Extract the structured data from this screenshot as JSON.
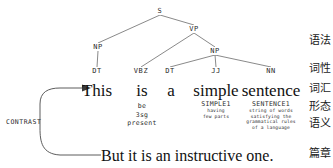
{
  "figure": {
    "background_color": "#ffffff",
    "line_color": "#6b6b6b",
    "text_color": "#1b1b1b"
  },
  "syntax_tree": {
    "nodes": [
      {
        "id": "S",
        "label": "S",
        "x": 160,
        "y": 11
      },
      {
        "id": "NP1",
        "label": "NP",
        "x": 98,
        "y": 47
      },
      {
        "id": "VP",
        "label": "VP",
        "x": 194,
        "y": 29
      },
      {
        "id": "NP2",
        "label": "NP",
        "x": 215,
        "y": 51
      },
      {
        "id": "DT1",
        "label": "DT",
        "x": 97,
        "y": 71
      },
      {
        "id": "VBZ",
        "label": "VBZ",
        "x": 141,
        "y": 71
      },
      {
        "id": "DT2",
        "label": "DT",
        "x": 170,
        "y": 71
      },
      {
        "id": "JJ",
        "label": "JJ",
        "x": 216,
        "y": 71
      },
      {
        "id": "NN",
        "label": "NN",
        "x": 271,
        "y": 71
      }
    ],
    "edges": [
      {
        "from": "S",
        "to": "NP1"
      },
      {
        "from": "S",
        "to": "VP"
      },
      {
        "from": "VP",
        "to": "VBZ"
      },
      {
        "from": "VP",
        "to": "NP2"
      },
      {
        "from": "NP1",
        "to": "DT1"
      },
      {
        "from": "NP2",
        "to": "DT2"
      },
      {
        "from": "NP2",
        "to": "JJ"
      },
      {
        "from": "NP2",
        "to": "NN"
      }
    ]
  },
  "sentence": {
    "text": "This is a simple sentence",
    "words": [
      {
        "text": "This",
        "x": 97,
        "y": 82
      },
      {
        "text": "is",
        "x": 142,
        "y": 82
      },
      {
        "text": "a",
        "x": 171,
        "y": 82
      },
      {
        "text": "simple",
        "x": 216,
        "y": 82
      },
      {
        "text": "sentence",
        "x": 271,
        "y": 82
      }
    ]
  },
  "glosses": [
    {
      "word": "is",
      "x": 142,
      "y": 102,
      "style": "plain",
      "sense": "",
      "lines": [
        "be",
        "3sg",
        "present"
      ]
    },
    {
      "word": "simple",
      "x": 216,
      "y": 100,
      "style": "sense",
      "sense": "SIMPLE1",
      "lines": [
        "having",
        "few parts"
      ]
    },
    {
      "word": "sentence",
      "x": 271,
      "y": 100,
      "style": "sense",
      "sense": "SENTENCE1",
      "lines": [
        "string of words",
        "satisfying the",
        "grammatical rules",
        "of a language"
      ]
    }
  ],
  "discourse": {
    "relation_label": "CONTRAST",
    "relation_label_x": 6,
    "relation_label_y": 118,
    "bottom_sentence": "But it is an instructive one.",
    "bottom_sentence_x": 101,
    "bottom_sentence_y": 147
  },
  "layer_labels": [
    {
      "text": "语法",
      "y": 41
    },
    {
      "text": "词性",
      "y": 69
    },
    {
      "text": "词汇",
      "y": 89
    },
    {
      "text": "形态",
      "y": 107
    },
    {
      "text": "语义",
      "y": 124
    },
    {
      "text": "篇章",
      "y": 154
    }
  ]
}
